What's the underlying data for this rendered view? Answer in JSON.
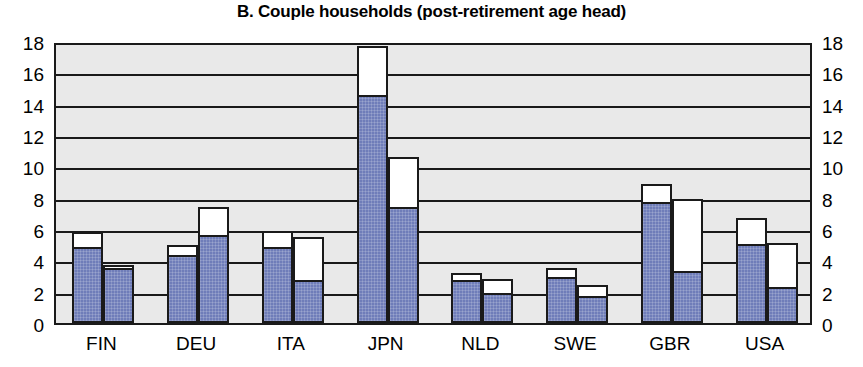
{
  "chart_data": {
    "type": "bar",
    "title": "B. Couple households (post-retirement age head)",
    "xlabel": "",
    "ylabel": "",
    "ylim": [
      0,
      18
    ],
    "yticks": [
      0,
      2,
      4,
      6,
      8,
      10,
      12,
      14,
      16,
      18
    ],
    "ytick_labels": [
      "0",
      "2",
      "4",
      "6",
      "8",
      "10",
      "12",
      "14",
      "16",
      "18"
    ],
    "grid": true,
    "legend": "none",
    "stacked": true,
    "axis_mirrored": true,
    "categories": [
      "FIN",
      "DEU",
      "ITA",
      "JPN",
      "NLD",
      "SWE",
      "GBR",
      "USA"
    ],
    "series": [
      {
        "name": "lower (blue filled) segment",
        "color": "#6f7db9",
        "bar1_values": [
          4.7,
          4.2,
          4.7,
          14.4,
          2.6,
          2.8,
          7.6,
          4.9
        ],
        "bar2_values": [
          3.4,
          5.5,
          2.6,
          7.3,
          1.8,
          1.6,
          3.2,
          2.2
        ]
      },
      {
        "name": "upper (white) segment total",
        "color": "#ffffff",
        "bar1_totals": [
          5.8,
          5.0,
          5.9,
          17.7,
          3.2,
          3.5,
          8.9,
          6.7
        ],
        "bar2_totals": [
          3.7,
          7.4,
          5.5,
          10.6,
          2.8,
          2.4,
          7.9,
          5.1
        ]
      }
    ],
    "bars": [
      {
        "category": "FIN",
        "bar1_total": 5.8,
        "bar1_blue": 4.7,
        "bar2_total": 3.7,
        "bar2_blue": 3.4
      },
      {
        "category": "DEU",
        "bar1_total": 5.0,
        "bar1_blue": 4.2,
        "bar2_total": 7.4,
        "bar2_blue": 5.5
      },
      {
        "category": "ITA",
        "bar1_total": 5.9,
        "bar1_blue": 4.7,
        "bar2_total": 5.5,
        "bar2_blue": 2.6
      },
      {
        "category": "JPN",
        "bar1_total": 17.7,
        "bar1_blue": 14.4,
        "bar2_total": 10.6,
        "bar2_blue": 7.3
      },
      {
        "category": "NLD",
        "bar1_total": 3.2,
        "bar1_blue": 2.6,
        "bar2_total": 2.8,
        "bar2_blue": 1.8
      },
      {
        "category": "SWE",
        "bar1_total": 3.5,
        "bar1_blue": 2.8,
        "bar2_total": 2.4,
        "bar2_blue": 1.6
      },
      {
        "category": "GBR",
        "bar1_total": 8.9,
        "bar1_blue": 7.6,
        "bar2_total": 7.9,
        "bar2_blue": 3.2
      },
      {
        "category": "USA",
        "bar1_total": 6.7,
        "bar1_blue": 4.9,
        "bar2_total": 5.1,
        "bar2_blue": 2.2
      }
    ],
    "colors": {
      "bar_fill": "#6f7db9",
      "bar_empty": "#ffffff",
      "plot_background": "#e9e9e9",
      "axis": "#1a1a1a",
      "text": "#000000"
    }
  }
}
